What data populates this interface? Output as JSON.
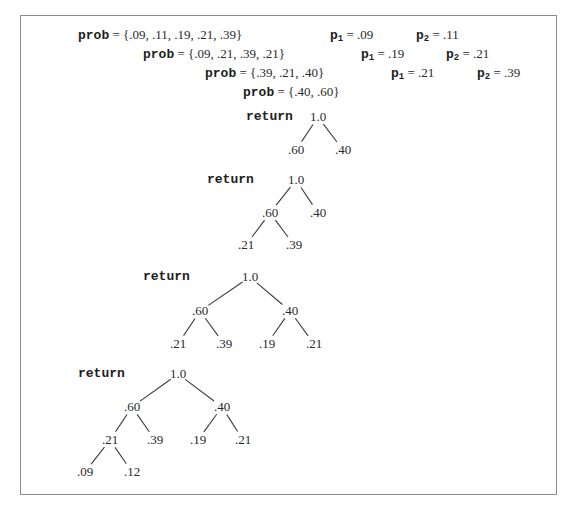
{
  "steps": [
    {
      "keyword": "prob",
      "equals": " = ",
      "value": "{.09, .11, .19, .21, .39}",
      "x": 78,
      "y": 28,
      "p1": {
        "label": "p",
        "sub": "1",
        "value": " = .09",
        "x": 330
      },
      "p2": {
        "label": "p",
        "sub": "2",
        "value": " = .11",
        "x": 416
      }
    },
    {
      "keyword": "prob",
      "equals": " = ",
      "value": "{.09, .21, .39, .21}",
      "x": 143,
      "y": 47,
      "p1": {
        "label": "p",
        "sub": "1",
        "value": " = .19",
        "x": 361
      },
      "p2": {
        "label": "p",
        "sub": "2",
        "value": " = .21",
        "x": 446
      }
    },
    {
      "keyword": "prob",
      "equals": " = ",
      "value": "{.39, .21, .40}",
      "x": 205,
      "y": 66,
      "p1": {
        "label": "p",
        "sub": "1",
        "value": " = .21",
        "x": 391
      },
      "p2": {
        "label": "p",
        "sub": "2",
        "value": " = .39",
        "x": 477
      }
    },
    {
      "keyword": "prob",
      "equals": " = ",
      "value": "{.40, .60}",
      "x": 243,
      "y": 85
    }
  ],
  "trees": [
    {
      "return_label": "return",
      "return_x": 246,
      "return_y": 117,
      "nodes": [
        {
          "id": "r",
          "label": "1.0",
          "x": 318,
          "y": 117
        },
        {
          "id": "a",
          "label": ".60",
          "x": 296,
          "y": 150,
          "parent": "r"
        },
        {
          "id": "b",
          "label": ".40",
          "x": 343,
          "y": 150,
          "parent": "r"
        }
      ]
    },
    {
      "return_label": "return",
      "return_x": 207,
      "return_y": 180,
      "nodes": [
        {
          "id": "r",
          "label": "1.0",
          "x": 296,
          "y": 180
        },
        {
          "id": "a",
          "label": ".60",
          "x": 270,
          "y": 213,
          "parent": "r"
        },
        {
          "id": "b",
          "label": ".40",
          "x": 318,
          "y": 213,
          "parent": "r"
        },
        {
          "id": "c",
          "label": ".21",
          "x": 246,
          "y": 245,
          "parent": "a"
        },
        {
          "id": "d",
          "label": ".39",
          "x": 294,
          "y": 245,
          "parent": "a"
        }
      ]
    },
    {
      "return_label": "return",
      "return_x": 143,
      "return_y": 277,
      "nodes": [
        {
          "id": "r",
          "label": "1.0",
          "x": 250,
          "y": 277
        },
        {
          "id": "a",
          "label": ".60",
          "x": 200,
          "y": 311,
          "parent": "r"
        },
        {
          "id": "b",
          "label": ".40",
          "x": 290,
          "y": 311,
          "parent": "r"
        },
        {
          "id": "c",
          "label": ".21",
          "x": 178,
          "y": 344,
          "parent": "a"
        },
        {
          "id": "d",
          "label": ".39",
          "x": 224,
          "y": 344,
          "parent": "a"
        },
        {
          "id": "e",
          "label": ".19",
          "x": 267,
          "y": 344,
          "parent": "b"
        },
        {
          "id": "f",
          "label": ".21",
          "x": 314,
          "y": 344,
          "parent": "b"
        }
      ]
    },
    {
      "return_label": "return",
      "return_x": 78,
      "return_y": 374,
      "nodes": [
        {
          "id": "r",
          "label": "1.0",
          "x": 178,
          "y": 374
        },
        {
          "id": "a",
          "label": ".60",
          "x": 132,
          "y": 407,
          "parent": "r"
        },
        {
          "id": "b",
          "label": ".40",
          "x": 222,
          "y": 407,
          "parent": "r"
        },
        {
          "id": "c",
          "label": ".21",
          "x": 110,
          "y": 440,
          "parent": "a"
        },
        {
          "id": "d",
          "label": ".39",
          "x": 155,
          "y": 440,
          "parent": "a"
        },
        {
          "id": "e",
          "label": ".19",
          "x": 198,
          "y": 440,
          "parent": "b"
        },
        {
          "id": "f",
          "label": ".21",
          "x": 243,
          "y": 440,
          "parent": "b"
        },
        {
          "id": "g",
          "label": ".09",
          "x": 85,
          "y": 472,
          "parent": "c"
        },
        {
          "id": "h",
          "label": ".12",
          "x": 132,
          "y": 472,
          "parent": "c"
        }
      ]
    }
  ]
}
